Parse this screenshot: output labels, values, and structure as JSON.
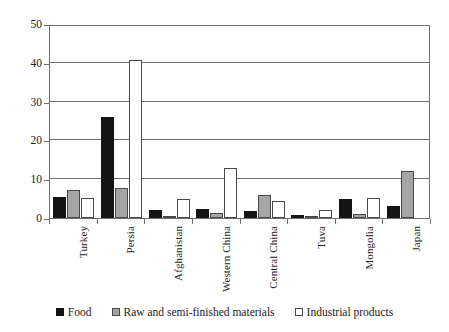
{
  "chart_data": {
    "type": "bar",
    "title": "",
    "xlabel": "",
    "ylabel": "",
    "ylim": [
      0,
      50
    ],
    "yticks": [
      0,
      10,
      20,
      30,
      40,
      50
    ],
    "grid": true,
    "legend_position": "bottom",
    "categories": [
      "Turkey",
      "Persia",
      "Afghanistan",
      "Western China",
      "Central China",
      "Tuva",
      "Mongolia",
      "Japan"
    ],
    "series": [
      {
        "name": "Food",
        "color": "#141414",
        "values": [
          5.3,
          26,
          2.0,
          2.4,
          1.7,
          0.8,
          5.0,
          3.0
        ]
      },
      {
        "name": "Raw  and semi-finished materials",
        "color": "#a5a5a5",
        "values": [
          7.3,
          7.8,
          0.4,
          1.4,
          5.9,
          0.4,
          1.1,
          12.1
        ]
      },
      {
        "name": "Industrial products",
        "color": "#ffffff",
        "values": [
          5.1,
          40.8,
          5.0,
          12.8,
          4.4,
          2.0,
          5.2,
          0
        ]
      }
    ]
  },
  "axis": {
    "ytick_labels": [
      "50",
      "40",
      "30",
      "20",
      "10",
      "0"
    ]
  },
  "legend": {
    "items": [
      {
        "label": "Food",
        "swatch": "food-swatch-icon"
      },
      {
        "label": "Raw  and semi-finished materials",
        "swatch": "raw-swatch-icon"
      },
      {
        "label": "Industrial products",
        "swatch": "industrial-swatch-icon"
      }
    ]
  }
}
